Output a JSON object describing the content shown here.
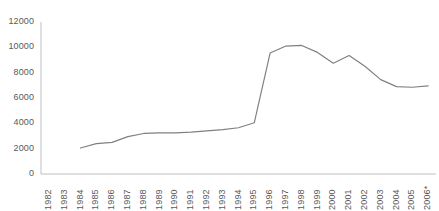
{
  "chart_data": {
    "type": "line",
    "title": "",
    "subtitle": "",
    "xlabel": "",
    "ylabel": "",
    "grid": false,
    "legend": "none",
    "line_color": "#808080",
    "axis_color": "#bfbfbf",
    "tick_label_color": "#595959",
    "ylim": [
      0,
      12000
    ],
    "ytick_values": [
      0,
      2000,
      4000,
      6000,
      8000,
      10000,
      12000
    ],
    "ytick_labels": [
      "0",
      "2000",
      "4000",
      "6000",
      "8000",
      "10000",
      "12000"
    ],
    "categories": [
      "1982",
      "1983",
      "1984",
      "1985",
      "1986",
      "1987",
      "1988",
      "1989",
      "1990",
      "1991",
      "1992",
      "1993",
      "1994",
      "1995",
      "1996",
      "1997",
      "1998",
      "1999",
      "2000",
      "2001",
      "2002",
      "2003",
      "2004",
      "2005",
      "2006*"
    ],
    "x_start_index": 2,
    "footnote_marker": "*",
    "series": [
      {
        "name": "Series 1",
        "x": [
          "1984",
          "1985",
          "1986",
          "1987",
          "1988",
          "1989",
          "1990",
          "1991",
          "1992",
          "1993",
          "1994",
          "1995",
          "1996",
          "1997",
          "1998",
          "1999",
          "2000",
          "2001",
          "2002",
          "2003",
          "2004",
          "2005",
          "2006*"
        ],
        "values": [
          2050,
          2400,
          2500,
          2950,
          3200,
          3250,
          3250,
          3300,
          3400,
          3500,
          3650,
          4050,
          9550,
          10100,
          10150,
          9600,
          8750,
          9350,
          8500,
          7450,
          6900,
          6850,
          6950
        ]
      }
    ]
  }
}
